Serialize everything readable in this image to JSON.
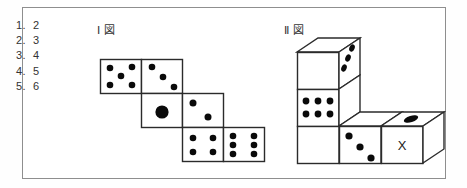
{
  "page": {
    "background": "#ffffff",
    "border_color": "#8e8e8e",
    "ink_color": "#2b2b2b",
    "pip_color": "#0a0a0a"
  },
  "choices": [
    {
      "number": "1.",
      "value": "2"
    },
    {
      "number": "2.",
      "value": "3"
    },
    {
      "number": "3.",
      "value": "4"
    },
    {
      "number": "4.",
      "value": "5"
    },
    {
      "number": "5.",
      "value": "6"
    }
  ],
  "figures": [
    {
      "id": "figure-1",
      "caption": "Ⅰ 図",
      "type": "dice-net",
      "faces": [
        {
          "name": "net-face-top-left",
          "pips": 5,
          "note": "five dots"
        },
        {
          "name": "net-face-top-right",
          "pips": 3,
          "note": "three dots diagonal"
        },
        {
          "name": "net-face-middle-left",
          "pips": 1,
          "note": "one large dot"
        },
        {
          "name": "net-face-middle-right",
          "pips": 2,
          "note": "two dots diagonal"
        },
        {
          "name": "net-face-bottom-left",
          "pips": 4,
          "note": "four dots"
        },
        {
          "name": "net-face-bottom-right",
          "pips": 6,
          "note": "six dots"
        }
      ]
    },
    {
      "id": "figure-2",
      "caption": "Ⅱ 図",
      "type": "dice-solid-assembly",
      "faces": [
        {
          "name": "cube-top-front",
          "pips": 0,
          "note": "blank front of upper cube"
        },
        {
          "name": "cube-top-right",
          "pips": 3,
          "note": "three dots on right side"
        },
        {
          "name": "cube-top-cap",
          "pips": 0,
          "note": "blank top"
        },
        {
          "name": "cube-middle-front",
          "pips": 6,
          "note": "six dots"
        },
        {
          "name": "cube-bottom-front",
          "pips": 0,
          "note": "blank"
        },
        {
          "name": "cube-row-left",
          "pips": 0,
          "note": "blank front"
        },
        {
          "name": "cube-row-middle",
          "pips": 3,
          "note": "three dots diagonal"
        },
        {
          "name": "cube-row-right",
          "label": "X",
          "note": "face marked X"
        },
        {
          "name": "cube-row-right-top",
          "pips": 1,
          "note": "single dot on top"
        }
      ],
      "marked_face_label": "X"
    }
  ]
}
